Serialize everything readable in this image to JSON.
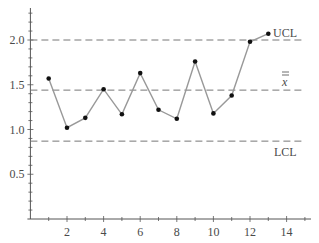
{
  "chart_data": {
    "type": "line",
    "title": "",
    "xlabel": "",
    "ylabel": "",
    "x": [
      1,
      2,
      3,
      4,
      5,
      6,
      7,
      8,
      9,
      10,
      11,
      12,
      13
    ],
    "series": [
      {
        "name": "sample means",
        "values": [
          1.57,
          1.02,
          1.13,
          1.45,
          1.17,
          1.63,
          1.22,
          1.12,
          1.76,
          1.18,
          1.38,
          1.98,
          2.07
        ],
        "color": "#999999",
        "marker_color": "#111111"
      }
    ],
    "reference_lines": [
      {
        "name": "UCL",
        "label": "UCL",
        "y": 2.0,
        "style": "dashed"
      },
      {
        "name": "center",
        "label": "x̿",
        "y": 1.44,
        "style": "dashed"
      },
      {
        "name": "LCL",
        "label": "LCL",
        "y": 0.87,
        "style": "dashed"
      }
    ],
    "xticks": [
      2,
      4,
      6,
      8,
      10,
      12,
      14
    ],
    "xtick_labels": [
      "2",
      "4",
      "6",
      "8",
      "10",
      "12",
      "14"
    ],
    "yticks": [
      0.5,
      1.0,
      1.5,
      2.0
    ],
    "ytick_labels": [
      "0.5",
      "1.0",
      "1.5",
      "2.0"
    ],
    "xlim": [
      0,
      15.2
    ],
    "ylim": [
      0,
      2.35
    ],
    "grid": false,
    "legend": "none"
  },
  "labels": {
    "ucl": "UCL",
    "center": "x",
    "lcl": "LCL"
  }
}
